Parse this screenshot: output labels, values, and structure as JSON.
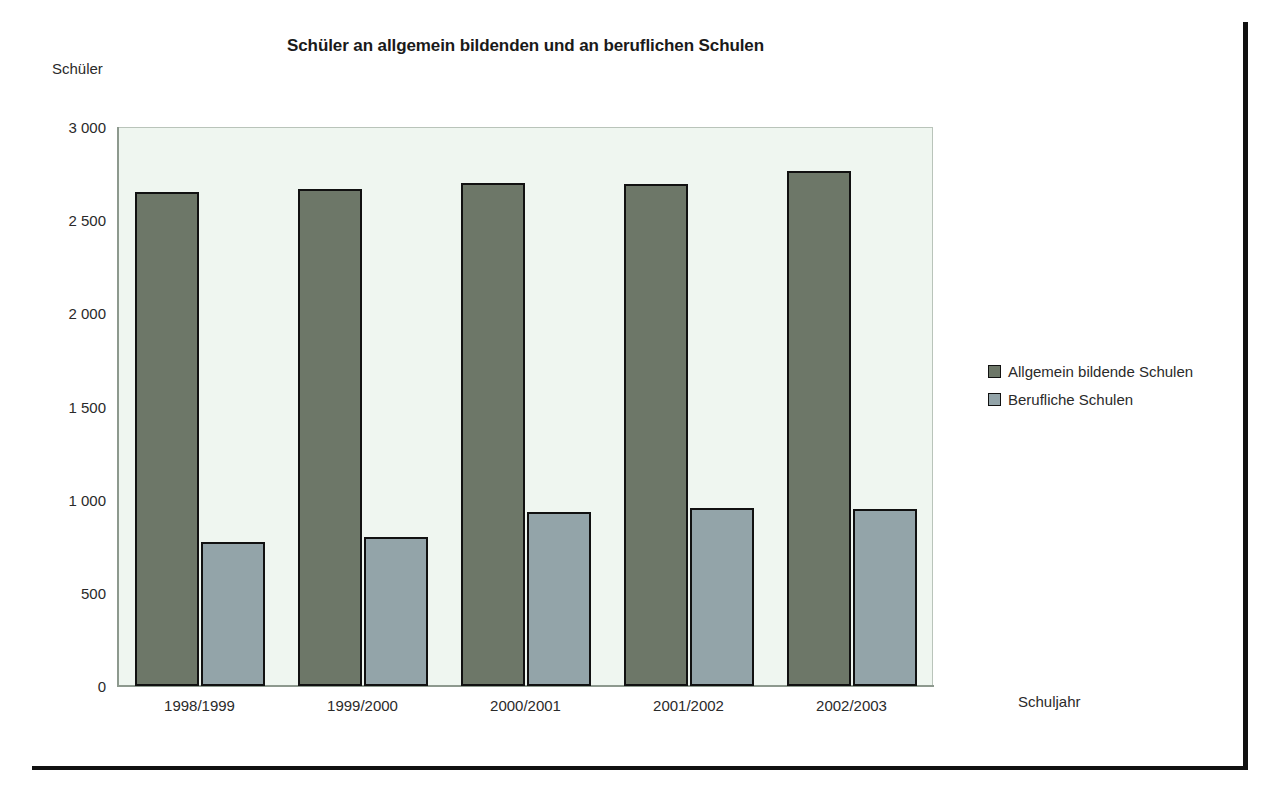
{
  "chart_data": {
    "type": "bar",
    "title": "Schüler an allgemein bildenden und an beruflichen Schulen",
    "xlabel": "Schuljahr",
    "ylabel": "Schüler",
    "categories": [
      "1998/1999",
      "1999/2000",
      "2000/2001",
      "2001/2002",
      "2002/2003"
    ],
    "series": [
      {
        "name": "Allgemein bildende Schulen",
        "color": "#6d7768",
        "values": [
          2650,
          2665,
          2700,
          2695,
          2765
        ]
      },
      {
        "name": "Berufliche Schulen",
        "color": "#93a4a9",
        "values": [
          775,
          800,
          935,
          955,
          950
        ]
      }
    ],
    "ylim": [
      0,
      3000
    ],
    "y_ticks": [
      0,
      500,
      1000,
      1500,
      2000,
      2500,
      3000
    ],
    "y_tick_labels": [
      "0",
      "500",
      "1 000",
      "1 500",
      "2 000",
      "2 500",
      "3 000"
    ],
    "grid": false,
    "legend_position": "right",
    "plot_background": "#eff6f0"
  },
  "legend": {
    "items": [
      {
        "label": "Allgemein bildende Schulen",
        "color": "#6d7768"
      },
      {
        "label": "Berufliche Schulen",
        "color": "#93a4a9"
      }
    ]
  }
}
